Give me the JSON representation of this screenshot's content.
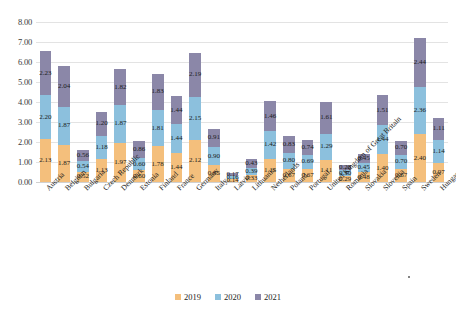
{
  "chart_data": {
    "type": "bar",
    "subtype": "stacked-vertical",
    "title": "",
    "xlabel": "",
    "ylabel": "",
    "ylim": [
      0.0,
      8.0
    ],
    "ytick_step": 1.0,
    "ytick_labels": [
      "0.00",
      "1.00",
      "2.00",
      "3.00",
      "4.00",
      "5.00",
      "6.00",
      "7.00",
      "8.00"
    ],
    "grid": true,
    "legend_position": "bottom",
    "value_labels": true,
    "label_format": "0.00",
    "categories": [
      "Austria",
      "Belgium",
      "Bulgaria",
      "Czech Republic",
      "Denmark",
      "Estonia",
      "Finland",
      "France",
      "Germany",
      "Italy",
      "Latvia",
      "Lithuania",
      "Netherlands",
      "Poland",
      "Portugal",
      "United Kingdom of Great Britain",
      "Romania",
      "Slovakia",
      "Slovenia",
      "Spain",
      "Sweden",
      "Hungary"
    ],
    "series": [
      {
        "name": "2019",
        "color": "#f4bf7c",
        "values": [
          2.13,
          1.87,
          0.52,
          1.13,
          1.97,
          0.6,
          1.78,
          1.44,
          2.12,
          0.85,
          0.14,
          0.33,
          1.15,
          0.67,
          0.67,
          1.11,
          0.29,
          0.48,
          1.4,
          0.67,
          2.4,
          0.97
        ]
      },
      {
        "name": "2020",
        "color": "#8cc0dd",
        "values": [
          2.2,
          1.87,
          0.54,
          1.18,
          1.87,
          0.6,
          1.81,
          1.44,
          2.15,
          0.9,
          0.16,
          0.39,
          1.42,
          0.8,
          0.69,
          1.29,
          0.3,
          0.45,
          1.44,
          0.7,
          2.36,
          1.14
        ]
      },
      {
        "name": "2021",
        "color": "#8b87a8",
        "values": [
          2.23,
          2.04,
          0.56,
          1.2,
          1.82,
          0.86,
          1.83,
          1.44,
          2.19,
          0.91,
          0.17,
          0.43,
          1.46,
          0.83,
          0.74,
          1.61,
          0.28,
          0.45,
          1.51,
          0.7,
          2.44,
          1.11
        ]
      }
    ]
  },
  "legend": {
    "items": [
      {
        "label": "2019",
        "color": "#f4bf7c"
      },
      {
        "label": "2020",
        "color": "#8cc0dd"
      },
      {
        "label": "2021",
        "color": "#8b87a8"
      }
    ]
  }
}
